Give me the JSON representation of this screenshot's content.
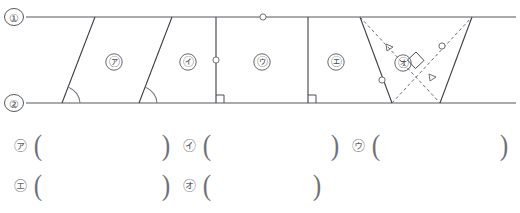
{
  "figure": {
    "line_labels": [
      {
        "id": "line-1",
        "text": "①",
        "x": 14,
        "y": 18
      },
      {
        "id": "line-2",
        "text": "②",
        "x": 14,
        "y": 103
      }
    ],
    "parallel_lines": [
      {
        "id": "top-line",
        "y": 17,
        "x1": 26,
        "x2": 516
      },
      {
        "id": "bottom-line",
        "y": 103,
        "x1": 26,
        "x2": 516
      }
    ],
    "shapes": [
      {
        "id": "shape-a",
        "label": "㋐",
        "label_x": 114,
        "label_y": 62,
        "type": "parallelogram",
        "left_top_x": 95,
        "left_bottom_x": 62,
        "right_top_x": 172,
        "right_bottom_x": 139,
        "marks": [
          "angle-arc-bottom-left"
        ]
      },
      {
        "id": "shape-b",
        "label": "㋑",
        "label_x": 188,
        "label_y": 62,
        "type": "trapezoid",
        "left_top_x": 172,
        "left_bottom_x": 139,
        "right_top_x": 216,
        "right_bottom_x": 216,
        "marks": [
          "angle-arc-bottom-left",
          "right-angle-bottom-right"
        ]
      },
      {
        "id": "shape-c",
        "label": "㋒",
        "label_x": 262,
        "label_y": 62,
        "type": "rectangle",
        "left_top_x": 216,
        "left_bottom_x": 216,
        "right_top_x": 308,
        "right_bottom_x": 308,
        "marks": [
          "tick-left-side",
          "tick-top-side",
          "right-angle-bottom-left",
          "right-angle-bottom-right"
        ]
      },
      {
        "id": "shape-d",
        "label": "㋓",
        "label_x": 336,
        "label_y": 62,
        "type": "trapezoid",
        "left_top_x": 308,
        "left_bottom_x": 308,
        "right_top_x": 360,
        "right_bottom_x": 392,
        "marks": [
          "right-angle-bottom-left"
        ]
      },
      {
        "id": "shape-e",
        "label": "㋔",
        "label_x": 403,
        "label_y": 63,
        "type": "rhombus",
        "left_top_x": 360,
        "left_bottom_x": 392,
        "right_top_x": 472,
        "right_bottom_x": 440,
        "marks": [
          "diagonals-dashed",
          "right-angle-at-intersection",
          "tick-circle-diagonal",
          "tick-triangle-diagonal"
        ]
      }
    ],
    "diagonal_ticks": [
      {
        "id": "tick-triangle-upper",
        "shape": "triangle",
        "x": 390,
        "y": 47
      },
      {
        "id": "tick-triangle-lower",
        "shape": "triangle",
        "x": 433,
        "y": 77
      },
      {
        "id": "tick-circle-upper",
        "shape": "circle",
        "x": 442,
        "y": 46
      },
      {
        "id": "tick-circle-lower",
        "shape": "circle",
        "x": 382,
        "y": 80
      }
    ],
    "side_ticks": [
      {
        "id": "tick-top-line",
        "shape": "circle",
        "x": 263,
        "y": 17
      },
      {
        "id": "tick-left-vertical",
        "shape": "circle",
        "x": 216,
        "y": 60
      }
    ],
    "colors": {
      "stroke": "#3c3f44",
      "dashed": "#6a6d73",
      "label": "#4a4d52",
      "line": "#55585e"
    }
  },
  "answers": {
    "rows": [
      {
        "id": "answer-row-1",
        "items": [
          {
            "id": "answer-a",
            "label": "㋐",
            "open": "(",
            "close": ")",
            "x": 14,
            "width": 148
          },
          {
            "id": "answer-b",
            "label": "㋑",
            "open": "(",
            "close": ")",
            "x": 183,
            "width": 148
          },
          {
            "id": "answer-c",
            "label": "㋒",
            "open": "(",
            "close": ")",
            "x": 352,
            "width": 148
          }
        ]
      },
      {
        "id": "answer-row-2",
        "items": [
          {
            "id": "answer-d",
            "label": "㋓",
            "open": "(",
            "close": ")",
            "x": 14,
            "width": 148
          },
          {
            "id": "answer-e",
            "label": "㋔",
            "open": "(",
            "close": ")",
            "x": 183,
            "width": 130
          }
        ]
      }
    ]
  }
}
